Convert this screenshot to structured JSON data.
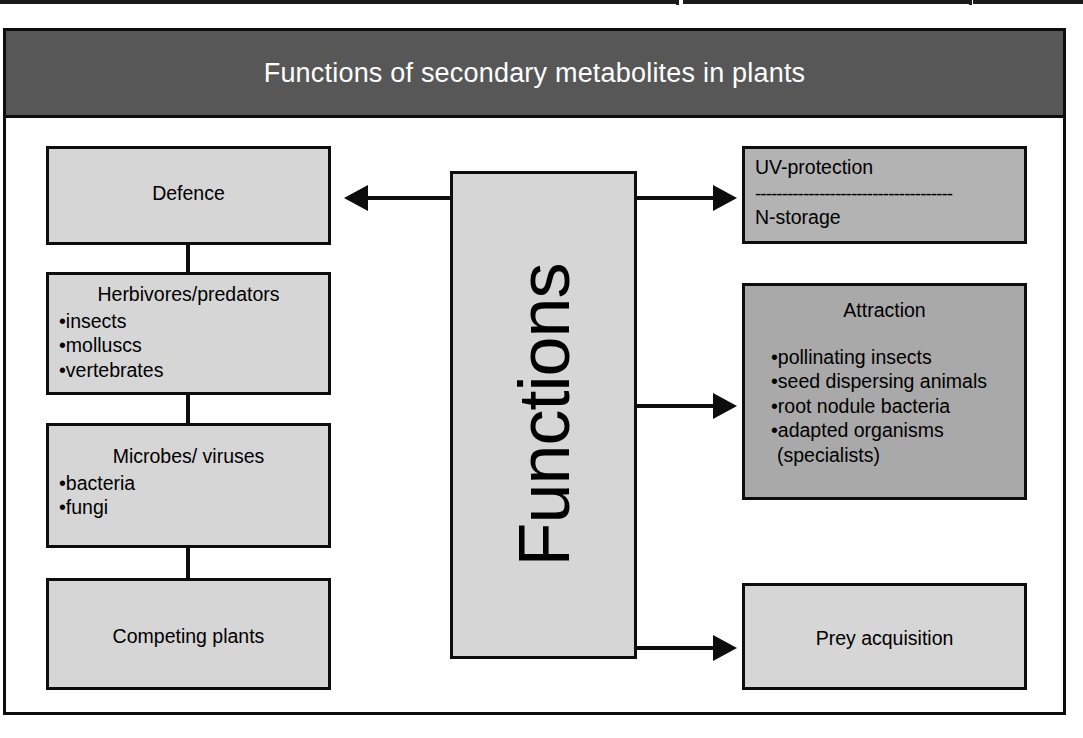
{
  "header": {
    "title": "Functions of secondary metabolites in plants"
  },
  "center": {
    "label": "Functions"
  },
  "left_column": {
    "defence": {
      "title": "Defence"
    },
    "herbivores": {
      "title": "Herbivores/predators",
      "items": [
        "insects",
        "molluscs",
        "vertebrates"
      ]
    },
    "microbes": {
      "title": "Microbes/ viruses",
      "items": [
        "bacteria",
        "fungi"
      ]
    },
    "competing": {
      "title": "Competing plants"
    }
  },
  "right_column": {
    "uv_storage": {
      "line1": "UV-protection",
      "divider": "-------------------------------------",
      "line2": "N-storage"
    },
    "attraction": {
      "title": "Attraction",
      "items": [
        "pollinating insects",
        "seed dispersing animals",
        "root nodule bacteria",
        "adapted organisms"
      ],
      "continuation": "(specialists)"
    },
    "prey": {
      "title": "Prey acquisition"
    }
  },
  "arrows": {
    "to_defence": "arrow-left-to-defence",
    "to_uv": "arrow-right-to-uv-storage",
    "to_attraction": "arrow-right-to-attraction",
    "to_prey": "arrow-right-to-prey"
  },
  "colors": {
    "header_band": "#575757",
    "box_light": "#d6d6d6",
    "box_mid": "#a9a9a9",
    "stroke": "#0d0d0d",
    "header_text": "#ffffff",
    "page_background": "#ffffff"
  },
  "bullet_glyph": "•"
}
